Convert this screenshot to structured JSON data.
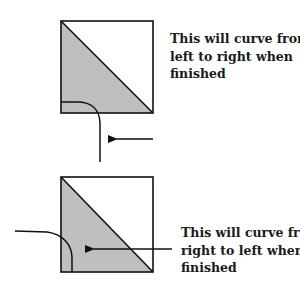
{
  "colors": {
    "fill": "#bfbfbf",
    "stroke": "#111111",
    "background": "#ffffff"
  },
  "panels": [
    {
      "id": "top",
      "caption_lines": [
        "This will curve from",
        "left to right when",
        "finished"
      ],
      "arrow_direction": "left",
      "curve_direction": "left-to-right"
    },
    {
      "id": "bottom",
      "caption_lines": [
        "This will curve from",
        "right to left when",
        "finished"
      ],
      "arrow_direction": "left",
      "curve_direction": "right-to-left"
    }
  ]
}
